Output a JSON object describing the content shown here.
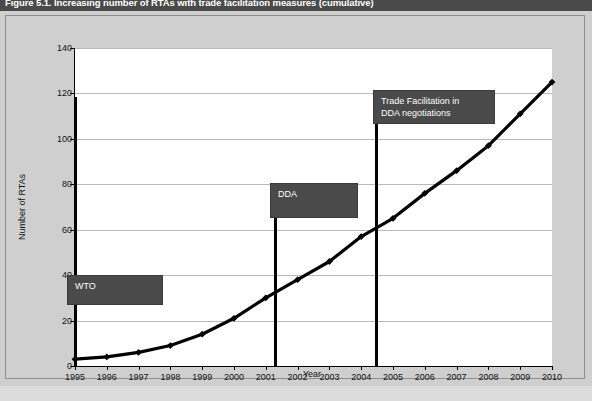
{
  "figure": {
    "title": "Figure 5.1. Increasing number of RTAs with trade facilitation measures (cumulative)"
  },
  "annotations": [
    {
      "id": "wto",
      "label": "WTO",
      "year": 1995
    },
    {
      "id": "dda",
      "label": "DDA",
      "year": 2001
    },
    {
      "id": "tf-dda",
      "label": "Trade Facilitation  in\nDDA negotiations",
      "year": 2004
    }
  ],
  "colors": {
    "title_band": "#4a4a4a",
    "annotation_box": "#4a4a4a",
    "page_background": "#cfcfcf",
    "plot_background": "#ffffff",
    "series_line": "#000000",
    "gridline": "#b9b9b9"
  },
  "chart_data": {
    "type": "line",
    "title": "Figure 5.1. Increasing number of RTAs with trade facilitation measures (cumulative)",
    "xlabel": "Year",
    "ylabel": "Number of RTAs",
    "categories": [
      1995,
      1996,
      1997,
      1998,
      1999,
      2000,
      2001,
      2002,
      2003,
      2004,
      2005,
      2006,
      2007,
      2008,
      2009,
      2010
    ],
    "x_tick_labels": [
      "1995",
      "1996",
      "1997",
      "1998",
      "1999",
      "2000",
      "2001",
      "2002",
      "2003",
      "2004",
      "2005",
      "2006",
      "2007",
      "2008",
      "2009",
      "2010"
    ],
    "y_tick_labels": [
      "0",
      "20",
      "40",
      "60",
      "80",
      "100",
      "120",
      "140"
    ],
    "y_ticks": [
      0,
      20,
      40,
      60,
      80,
      100,
      120,
      140
    ],
    "values": [
      3,
      4,
      6,
      9,
      14,
      21,
      30,
      38,
      46,
      57,
      65,
      76,
      86,
      97,
      111,
      125
    ],
    "xlim": [
      1995,
      2010
    ],
    "ylim": [
      0,
      140
    ],
    "grid": "horizontal",
    "legend": "none",
    "marker": "diamond",
    "annotations": [
      {
        "text": "WTO",
        "at_year": 1995
      },
      {
        "text": "DDA",
        "at_year": 2001
      },
      {
        "text": "Trade Facilitation  in DDA negotiations",
        "at_year": 2004
      }
    ]
  }
}
